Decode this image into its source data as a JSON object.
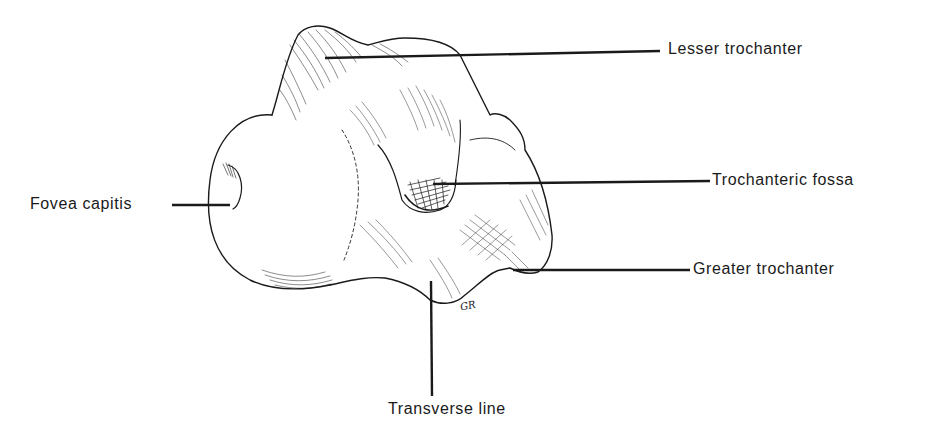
{
  "figure": {
    "artist_signature": "GR",
    "ink_color": "#1a1a1a",
    "background_color": "#ffffff"
  },
  "labels": [
    {
      "id": "lesser-trochanter",
      "text": "Lesser trochanter"
    },
    {
      "id": "fovea-capitis",
      "text": "Fovea capitis"
    },
    {
      "id": "trochanteric-fossa",
      "text": "Trochanteric fossa"
    },
    {
      "id": "greater-trochanter",
      "text": "Greater  trochanter"
    },
    {
      "id": "transverse-line",
      "text": "Transverse  line"
    }
  ]
}
